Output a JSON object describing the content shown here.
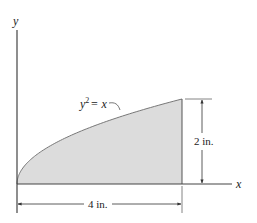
{
  "figure": {
    "type": "area-under-curve diagram",
    "colors": {
      "fill": "#dcdcdc",
      "line": "#555555",
      "text": "#222222",
      "background": "#ffffff"
    },
    "axes": {
      "x_label": "x",
      "y_label": "y"
    },
    "curve": {
      "equation_lhs": "y",
      "equation_exp": "2",
      "equation_rhs": "= x",
      "x_max_in": 4,
      "y_max_in": 2
    },
    "dimensions": {
      "width_label": "4 in.",
      "height_label": "2 in."
    }
  }
}
